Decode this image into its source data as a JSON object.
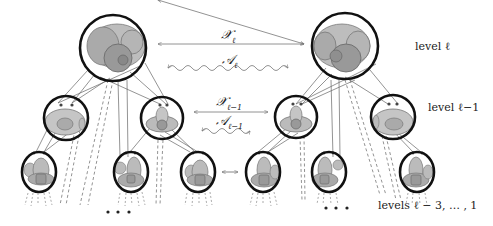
{
  "diagram": {
    "left_tree": {
      "levels": 3,
      "root": "top circle",
      "children_level_l_minus_1": 2,
      "children_level_l_minus_2": 3
    },
    "right_tree": {
      "levels": 3,
      "root": "top circle",
      "children_level_l_minus_1": 2,
      "children_level_l_minus_2": 3
    }
  },
  "labels": {
    "level_l": "level ℓ",
    "level_l_minus_1": "level ℓ−1",
    "levels_lower": "levels ℓ − 3, … , 1",
    "ellipsis_left": "• • •",
    "ellipsis_right": "• • •"
  },
  "arrows": {
    "X_l": {
      "symbol": "𝒳",
      "sub": "ℓ",
      "type": "straight-double"
    },
    "A_l": {
      "symbol": "𝒜",
      "sub": "ℓ",
      "type": "wavy-double"
    },
    "X_l_minus_1": {
      "symbol": "𝒳",
      "sub": "ℓ−1",
      "type": "straight-double"
    },
    "A_l_minus_1": {
      "symbol": "𝒜",
      "sub": "ℓ−1",
      "type": "wavy-double"
    },
    "small_link": {
      "symbol": "⟷"
    }
  },
  "colors": {
    "circle_stroke": "#111111",
    "fill_light": "#c8c8c8",
    "fill_mid": "#a8a8a8",
    "fill_dark": "#8a8a8a",
    "line": "#555555",
    "arrow": "#777777"
  }
}
